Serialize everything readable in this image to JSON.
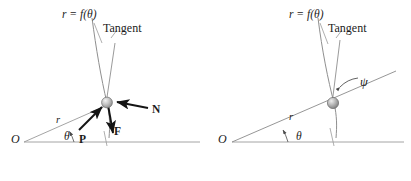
{
  "figure": {
    "name": "polar-curve-bead-force-diagram",
    "background_color": "#ffffff",
    "ink_color": "#1b1b1b",
    "line_color": "#8c8c8c",
    "curve_color": "#8f8f8f",
    "bead_fill": "#b4b4b4",
    "panels": [
      {
        "id": "left",
        "caption_free": true,
        "labels": {
          "curve_equation": "r = f(θ)",
          "tangent": "Tangent",
          "origin": "O",
          "radius": "r",
          "theta": "θ",
          "force_P": "P",
          "force_F": "F",
          "force_N": "N"
        },
        "vectors": [
          {
            "name": "P",
            "label": "P",
            "description": "applied force along radius toward bead"
          },
          {
            "name": "F",
            "label": "F",
            "description": "force directed downward from bead"
          },
          {
            "name": "N",
            "label": "N",
            "description": "normal force pointing left toward bead"
          }
        ]
      },
      {
        "id": "right",
        "labels": {
          "curve_equation": "r = f(θ)",
          "tangent": "Tangent",
          "origin": "O",
          "radius": "r",
          "theta": "θ",
          "psi": "ψ"
        },
        "angles": [
          {
            "name": "theta",
            "label": "θ",
            "description": "polar angle between horizontal axis and radius vector"
          },
          {
            "name": "psi",
            "label": "ψ",
            "description": "angle between radius vector extension and tangent"
          }
        ]
      }
    ]
  }
}
